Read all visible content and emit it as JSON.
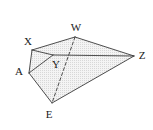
{
  "figure": {
    "type": "geometric-solid-diagram",
    "width": 153,
    "height": 130,
    "background_color": "#ffffff",
    "stroke_color": "#3a3a3a",
    "fill_color": "#efefef",
    "label_color": "#1a1a1a",
    "vertices": [
      {
        "id": "W",
        "label": "W",
        "x": 75,
        "y": 37,
        "label_x": 76,
        "label_y": 27
      },
      {
        "id": "X",
        "label": "X",
        "x": 32,
        "y": 50,
        "label_x": 28,
        "label_y": 41
      },
      {
        "id": "A",
        "label": "A",
        "x": 29,
        "y": 73,
        "label_x": 19,
        "label_y": 71
      },
      {
        "id": "Y",
        "label": "Y",
        "x": 53,
        "y": 55,
        "label_x": 56,
        "label_y": 64
      },
      {
        "id": "Z",
        "label": "Z",
        "x": 134,
        "y": 56,
        "label_x": 142,
        "label_y": 55
      },
      {
        "id": "E",
        "label": "E",
        "x": 52,
        "y": 103,
        "label_x": 49,
        "label_y": 114
      }
    ],
    "faces": [
      {
        "id": "face-XWZY",
        "points": "32,50 75,37 134,56 53,55"
      },
      {
        "id": "face-AYZE",
        "points": "29,73 53,55 134,56 52,103"
      },
      {
        "id": "face-XAY",
        "points": "32,50 29,73 53,55"
      }
    ],
    "edges": [
      {
        "id": "edge-X-W",
        "from": "X",
        "to": "W",
        "style": "solid"
      },
      {
        "id": "edge-W-Z",
        "from": "W",
        "to": "Z",
        "style": "solid"
      },
      {
        "id": "edge-X-Y",
        "from": "X",
        "to": "Y",
        "style": "solid"
      },
      {
        "id": "edge-X-A",
        "from": "X",
        "to": "A",
        "style": "solid"
      },
      {
        "id": "edge-A-Y",
        "from": "A",
        "to": "Y",
        "style": "solid"
      },
      {
        "id": "edge-Y-Z",
        "from": "Y",
        "to": "Z",
        "style": "solid"
      },
      {
        "id": "edge-A-E",
        "from": "A",
        "to": "E",
        "style": "solid"
      },
      {
        "id": "edge-E-Z",
        "from": "E",
        "to": "Z",
        "style": "solid"
      },
      {
        "id": "edge-W-E",
        "from": "W",
        "to": "E",
        "style": "dashed"
      }
    ]
  }
}
